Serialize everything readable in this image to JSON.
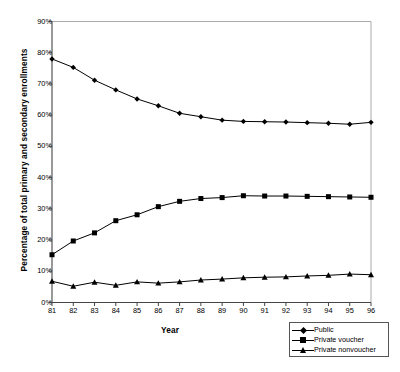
{
  "chart_data": {
    "type": "line",
    "title": "",
    "xlabel": "Year",
    "ylabel": "Percentage of total primary and secondary enrollments",
    "x": [
      81,
      82,
      83,
      84,
      85,
      86,
      87,
      88,
      89,
      90,
      91,
      92,
      93,
      94,
      95,
      96
    ],
    "xtick_labels": [
      "81",
      "82",
      "83",
      "84",
      "85",
      "86",
      "87",
      "88",
      "89",
      "90",
      "91",
      "92",
      "93",
      "94",
      "95",
      "96"
    ],
    "ytick_labels": [
      "0%",
      "10%",
      "20%",
      "30%",
      "40%",
      "50%",
      "60%",
      "70%",
      "80%",
      "90%"
    ],
    "ytick_values": [
      0,
      10,
      20,
      30,
      40,
      50,
      60,
      70,
      80,
      90
    ],
    "xlim": [
      81,
      96
    ],
    "ylim": [
      0,
      90
    ],
    "grid": false,
    "legend_position": "bottom-right",
    "series": [
      {
        "name": "Public",
        "marker": "diamond",
        "color": "#000000",
        "values": [
          78.0,
          75.3,
          71.2,
          68.1,
          65.2,
          63.0,
          60.6,
          59.5,
          58.4,
          58.0,
          57.9,
          57.8,
          57.6,
          57.4,
          57.1,
          57.7
        ]
      },
      {
        "name": "Private voucher",
        "marker": "square",
        "color": "#000000",
        "values": [
          15.3,
          19.7,
          22.3,
          26.2,
          28.1,
          30.7,
          32.4,
          33.3,
          33.6,
          34.2,
          34.1,
          34.1,
          34.0,
          33.9,
          33.8,
          33.7
        ]
      },
      {
        "name": "Private nonvoucher",
        "marker": "triangle",
        "color": "#000000",
        "values": [
          6.8,
          5.2,
          6.5,
          5.5,
          6.6,
          6.2,
          6.6,
          7.2,
          7.5,
          7.9,
          8.1,
          8.2,
          8.5,
          8.7,
          9.1,
          8.9
        ]
      }
    ]
  },
  "legend": {
    "items": [
      {
        "label": "Public",
        "marker": "diamond"
      },
      {
        "label": "Private voucher",
        "marker": "square"
      },
      {
        "label": "Private nonvoucher",
        "marker": "triangle"
      }
    ]
  },
  "axes": {
    "x_title": "Year",
    "y_title": "Percentage of total primary and secondary enrollments"
  }
}
